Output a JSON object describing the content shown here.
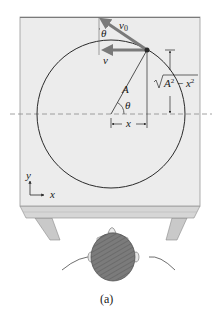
{
  "figure": {
    "caption": "(a)"
  },
  "labels": {
    "v0": "v",
    "v0_sub": "0",
    "v": "v",
    "theta_top": "θ",
    "theta_center": "θ",
    "radius": "A",
    "x": "x",
    "sqrt_expr": "A² − x²",
    "axis_y": "y",
    "axis_x": "x"
  },
  "colors": {
    "table_top": "#ececec",
    "table_edge": "#d4d4d4",
    "table_leg": "#c8c8c8",
    "arrow": "#7a7a7a",
    "line": "#2a2a2a",
    "hair": "#6e6e6e",
    "dashed": "#8c8c8c"
  },
  "geometry": {
    "circle_center": [
      111,
      114
    ],
    "circle_radius": 74,
    "particle": [
      147,
      50
    ]
  }
}
